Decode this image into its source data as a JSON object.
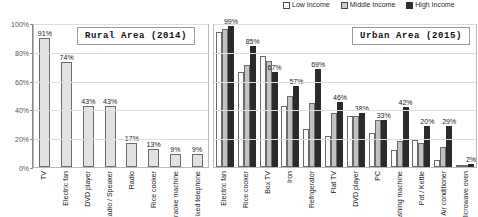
{
  "legend": {
    "position": "top-right",
    "items": [
      {
        "label": "Low Income",
        "key": "low",
        "color": "#ffffff"
      },
      {
        "label": "Middle Income",
        "key": "mid",
        "color": "#c2c2c2"
      },
      {
        "label": "High Income",
        "key": "high",
        "color": "#2b2b2b"
      }
    ]
  },
  "axis": {
    "yticks": [
      "0%",
      "20%",
      "40%",
      "60%",
      "80%",
      "100%"
    ],
    "ymin": 0,
    "ymax": 100
  },
  "panels": {
    "rural": {
      "title": "Rural Area  (2014)"
    },
    "urban": {
      "title": "Urban Area  (2015)"
    }
  },
  "chart_data": [
    {
      "type": "bar",
      "title": "Rural Area  (2014)",
      "xlabel": "",
      "ylabel": "",
      "ylim": [
        0,
        100
      ],
      "grid": true,
      "categories": [
        "TV",
        "Electric fan",
        "DVD player",
        "Radio / Speaker",
        "Radio",
        "Rice cooker",
        "Karaoke machine",
        "Fixed telephone"
      ],
      "series": [
        {
          "name": "Rural 2014",
          "values": [
            91,
            74,
            43,
            43,
            17,
            13,
            9,
            9
          ]
        }
      ],
      "data_labels": [
        "91%",
        "74%",
        "43%",
        "43%",
        "17%",
        "13%",
        "9%",
        "9%"
      ]
    },
    {
      "type": "bar",
      "title": "Urban Area  (2015)",
      "xlabel": "",
      "ylabel": "",
      "ylim": [
        0,
        100
      ],
      "grid": true,
      "categories": [
        "Electric fan",
        "Rice cooker",
        "Box TV",
        "Iron",
        "Refrigerator",
        "Flat TV",
        "DVD player",
        "PC",
        "Washing machine",
        "Pot / Kettle",
        "Air conditioner",
        "Microwave oven"
      ],
      "series": [
        {
          "name": "Low Income",
          "values": [
            95,
            67,
            78,
            43,
            27,
            22,
            36,
            24,
            12,
            19,
            5,
            1
          ]
        },
        {
          "name": "Middle Income",
          "values": [
            97,
            72,
            75,
            50,
            45,
            38,
            36,
            33,
            18,
            17,
            14,
            1
          ]
        },
        {
          "name": "High Income",
          "values": [
            99,
            85,
            67,
            57,
            69,
            46,
            38,
            33,
            42,
            29,
            29,
            2
          ]
        }
      ],
      "annotations": [
        {
          "category": "Electric fan",
          "text": "99%"
        },
        {
          "category": "Rice cooker",
          "text": "85%"
        },
        {
          "category": "Box TV",
          "text": "67%"
        },
        {
          "category": "Iron",
          "text": "57%"
        },
        {
          "category": "Refrigerator",
          "text": "69%"
        },
        {
          "category": "Flat TV",
          "text": "46%"
        },
        {
          "category": "DVD player",
          "text": "38%"
        },
        {
          "category": "PC",
          "text": "33%"
        },
        {
          "category": "Washing machine",
          "text": "42%"
        },
        {
          "category": "Pot / Kettle",
          "text": "20%"
        },
        {
          "category": "Air conditioner",
          "text": "29%"
        },
        {
          "category": "Microwave oven",
          "text": "2%"
        }
      ]
    }
  ]
}
